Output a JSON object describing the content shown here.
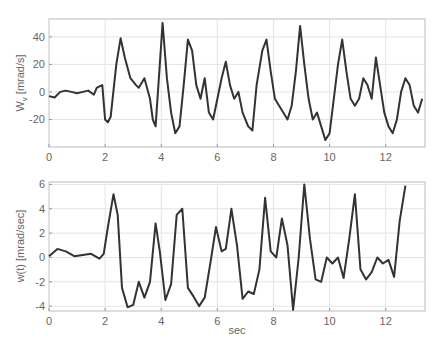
{
  "chart_data": [
    {
      "type": "line",
      "title": "",
      "xlabel": "",
      "ylabel": "W_v [mrad/s]",
      "xlim": [
        0,
        13.4
      ],
      "ylim": [
        -40,
        53
      ],
      "xticks": [
        0,
        2,
        4,
        6,
        8,
        10,
        12
      ],
      "yticks": [
        -20,
        0,
        20,
        40
      ],
      "grid": true,
      "series": [
        {
          "name": "W_v",
          "x": [
            0,
            0.2,
            0.4,
            0.6,
            0.8,
            1.0,
            1.2,
            1.4,
            1.6,
            1.7,
            1.8,
            1.9,
            2.0,
            2.1,
            2.2,
            2.4,
            2.55,
            2.7,
            2.9,
            3.1,
            3.2,
            3.4,
            3.6,
            3.7,
            3.8,
            3.95,
            4.05,
            4.2,
            4.35,
            4.5,
            4.65,
            4.8,
            4.95,
            5.1,
            5.25,
            5.4,
            5.55,
            5.7,
            5.85,
            6.0,
            6.15,
            6.3,
            6.45,
            6.6,
            6.75,
            6.9,
            7.1,
            7.25,
            7.4,
            7.6,
            7.75,
            7.9,
            8.05,
            8.2,
            8.35,
            8.5,
            8.65,
            8.8,
            8.95,
            9.1,
            9.25,
            9.4,
            9.55,
            9.7,
            9.85,
            10.0,
            10.15,
            10.3,
            10.45,
            10.6,
            10.75,
            10.9,
            11.05,
            11.2,
            11.35,
            11.5,
            11.65,
            11.8,
            11.95,
            12.1,
            12.25,
            12.4,
            12.55,
            12.7,
            12.85,
            13.0,
            13.15,
            13.3
          ],
          "y": [
            -3,
            -4,
            0,
            1,
            0,
            -1,
            0,
            1,
            -2,
            3,
            4,
            5,
            -20,
            -22,
            -18,
            20,
            39,
            25,
            10,
            5,
            3,
            10,
            -5,
            -20,
            -25,
            20,
            50,
            10,
            -15,
            -30,
            -25,
            5,
            38,
            30,
            5,
            -5,
            10,
            -15,
            -20,
            -5,
            10,
            22,
            5,
            -5,
            0,
            -15,
            -25,
            -28,
            5,
            30,
            38,
            15,
            -5,
            -10,
            -15,
            -20,
            -10,
            15,
            48,
            20,
            -5,
            -20,
            -15,
            -25,
            -35,
            -30,
            -5,
            20,
            38,
            15,
            -5,
            -10,
            -5,
            10,
            5,
            -5,
            25,
            5,
            -15,
            -25,
            -30,
            -20,
            0,
            10,
            5,
            -10,
            -15,
            -5,
            -5,
            10,
            15,
            -5,
            -10,
            25,
            10,
            -15,
            -25,
            -20,
            5
          ],
          "color": "#333333"
        }
      ]
    },
    {
      "type": "line",
      "title": "",
      "xlabel": "sec",
      "ylabel": "w(t) [mrad/sec]",
      "xlim": [
        0,
        13.4
      ],
      "ylim": [
        -4.4,
        6.2
      ],
      "xticks": [
        0,
        2,
        4,
        6,
        8,
        10,
        12
      ],
      "yticks": [
        -4,
        -2,
        0,
        2,
        4,
        6
      ],
      "grid": true,
      "series": [
        {
          "name": "w(t)",
          "x": [
            0,
            0.3,
            0.6,
            0.9,
            1.2,
            1.5,
            1.8,
            1.95,
            2.1,
            2.3,
            2.45,
            2.6,
            2.8,
            3.0,
            3.2,
            3.4,
            3.6,
            3.8,
            3.95,
            4.15,
            4.35,
            4.55,
            4.75,
            4.95,
            5.15,
            5.35,
            5.55,
            5.75,
            5.95,
            6.15,
            6.3,
            6.5,
            6.7,
            6.9,
            7.1,
            7.3,
            7.5,
            7.7,
            7.9,
            8.1,
            8.3,
            8.5,
            8.7,
            8.9,
            9.1,
            9.3,
            9.5,
            9.7,
            9.9,
            10.1,
            10.3,
            10.5,
            10.7,
            10.9,
            11.1,
            11.3,
            11.5,
            11.7,
            11.9,
            12.1,
            12.3,
            12.5,
            12.7,
            12.9,
            13.1,
            13.3
          ],
          "y": [
            0.1,
            0.7,
            0.5,
            0.1,
            0.2,
            0.3,
            -0.1,
            0.3,
            2.5,
            5.2,
            3.5,
            -2.5,
            -4.1,
            -3.9,
            -2.0,
            -3.3,
            -2.0,
            2.8,
            0.5,
            -3.5,
            -2.2,
            3.5,
            4.0,
            -2.5,
            -3.2,
            -4.0,
            -3.3,
            -0.5,
            2.5,
            0.5,
            0.7,
            4.0,
            1.0,
            -3.4,
            -2.8,
            -3.0,
            -1.0,
            4.9,
            0.5,
            0.0,
            3.2,
            1.0,
            -4.3,
            0.0,
            6.0,
            1.5,
            -1.8,
            -2.0,
            0.0,
            -0.5,
            0.0,
            -1.7,
            1.5,
            5.2,
            -1.0,
            -1.8,
            -1.2,
            0.0,
            -0.5,
            -0.2,
            -1.6,
            3.0,
            5.9
          ],
          "color": "#333333"
        }
      ]
    }
  ],
  "plots": {
    "top": {
      "ylabel": "W",
      "ylabel_sub": "v",
      "ylabel_unit": " [mrad/s]",
      "yticks": [
        "40",
        "20",
        "0",
        "-20"
      ],
      "xticks": [
        "0",
        "2",
        "4",
        "6",
        "8",
        "10",
        "12"
      ]
    },
    "bottom": {
      "ylabel": "w(t) [mrad/sec]",
      "yticks": [
        "6",
        "4",
        "2",
        "0",
        "-2",
        "-4"
      ],
      "xticks": [
        "0",
        "2",
        "4",
        "6",
        "8",
        "10",
        "12"
      ],
      "xlabel": "sec"
    }
  }
}
